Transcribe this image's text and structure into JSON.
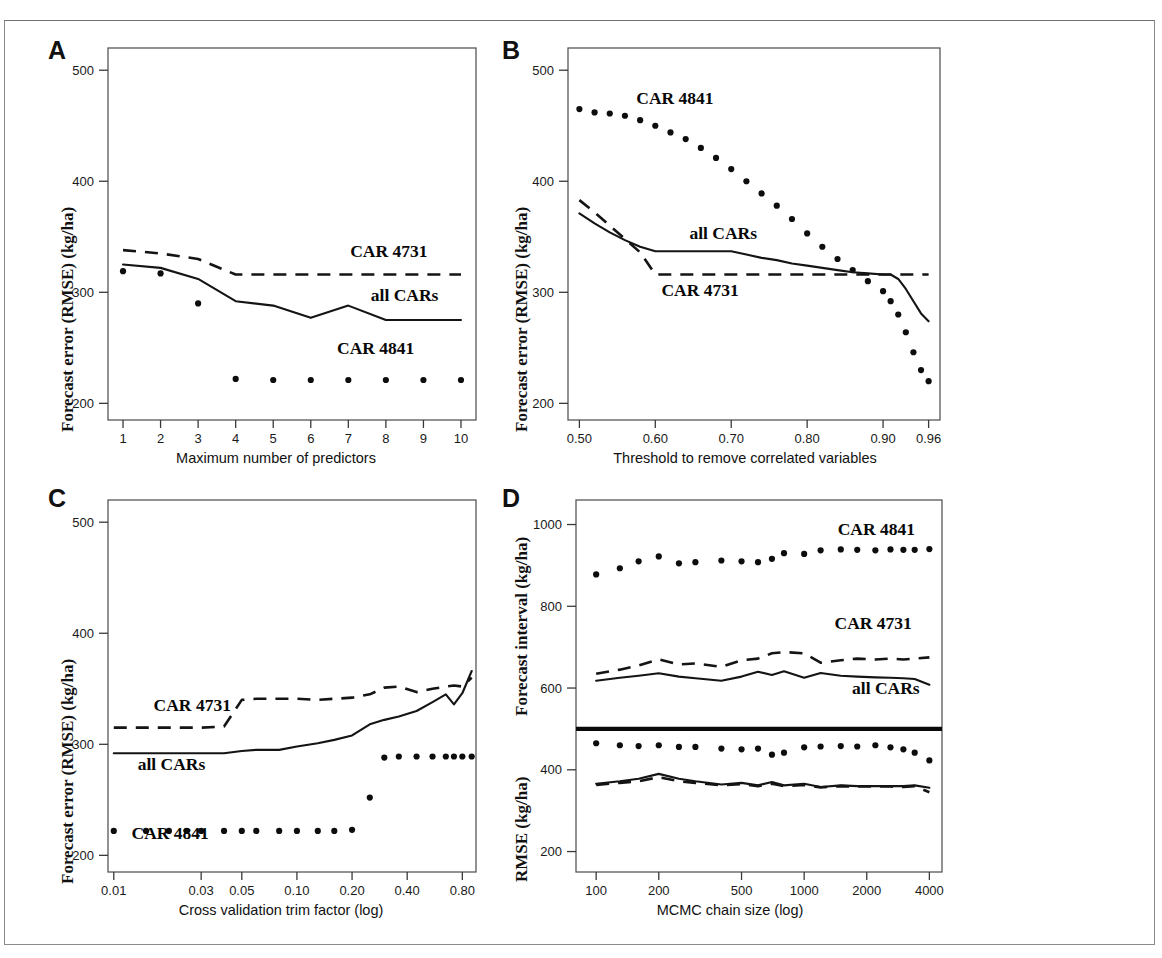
{
  "figure": {
    "panel_letters": [
      "A",
      "B",
      "C",
      "D"
    ],
    "series_names": [
      "CAR 4731",
      "all CARs",
      "CAR 4841"
    ],
    "line_styles": {
      "CAR 4731": "dashed",
      "all CARs": "solid",
      "CAR 4841": "dotted"
    },
    "ink_color": "#141414",
    "frame_color": "#4a4a4a",
    "background": "#ffffff"
  },
  "chart_data": [
    {
      "panel": "A",
      "type": "line",
      "title": "",
      "xlabel": "Maximum number of predictors",
      "ylabel": "Forecast error (RMSE) (kg/ha)",
      "xscale": "linear",
      "yscale": "linear",
      "xlim": [
        0.6,
        10.4
      ],
      "ylim": [
        185,
        520
      ],
      "xticks": [
        1,
        2,
        3,
        4,
        5,
        6,
        7,
        8,
        9,
        10
      ],
      "xticklabels": [
        "1",
        "2",
        "3",
        "4",
        "5",
        "6",
        "7",
        "8",
        "9",
        "10"
      ],
      "yticks": [
        200,
        300,
        400,
        500
      ],
      "yticklabels": [
        "200",
        "300",
        "400",
        "500"
      ],
      "grid": false,
      "legend": "inline-annotations",
      "x": [
        1,
        2,
        3,
        4,
        5,
        6,
        7,
        8,
        9,
        10
      ],
      "series": [
        {
          "name": "CAR 4731",
          "style": "dashed",
          "values": [
            338,
            335,
            330,
            316,
            316,
            316,
            316,
            316,
            316,
            316
          ],
          "label_pos": {
            "x": 7.05,
            "y": 332
          }
        },
        {
          "name": "all CARs",
          "style": "solid",
          "values": [
            325,
            322,
            312,
            292,
            288,
            277,
            288,
            275,
            275,
            275
          ],
          "label_pos": {
            "x": 7.6,
            "y": 292
          }
        },
        {
          "name": "CAR 4841",
          "style": "dotted",
          "values": [
            319,
            317,
            290,
            222,
            221,
            221,
            221,
            221,
            221,
            221
          ],
          "label_pos": {
            "x": 6.7,
            "y": 244
          }
        }
      ]
    },
    {
      "panel": "B",
      "type": "line",
      "title": "",
      "xlabel": "Threshold to remove correlated variables",
      "ylabel": "Forecast error (RMSE) (kg/ha)",
      "xscale": "linear",
      "yscale": "linear",
      "xlim": [
        0.485,
        0.975
      ],
      "ylim": [
        185,
        520
      ],
      "xticks": [
        0.5,
        0.6,
        0.7,
        0.8,
        0.9,
        0.96
      ],
      "xticklabels": [
        "0.50",
        "0.60",
        "0.70",
        "0.80",
        "0.90",
        "0.96"
      ],
      "yticks": [
        200,
        300,
        400,
        500
      ],
      "yticklabels": [
        "200",
        "300",
        "400",
        "500"
      ],
      "grid": false,
      "legend": "inline-annotations",
      "x": [
        0.5,
        0.52,
        0.54,
        0.56,
        0.58,
        0.6,
        0.62,
        0.64,
        0.66,
        0.68,
        0.7,
        0.72,
        0.74,
        0.76,
        0.78,
        0.8,
        0.82,
        0.84,
        0.86,
        0.88,
        0.9,
        0.91,
        0.92,
        0.93,
        0.94,
        0.95,
        0.96
      ],
      "series": [
        {
          "name": "CAR 4841",
          "style": "dotted",
          "values": [
            465,
            462,
            461,
            459,
            455,
            450,
            444,
            438,
            430,
            421,
            411,
            400,
            389,
            378,
            366,
            353,
            341,
            330,
            320,
            310,
            301,
            292,
            280,
            264,
            246,
            230,
            220
          ],
          "label_pos": {
            "x": 0.575,
            "y": 470
          }
        },
        {
          "name": "all CARs",
          "style": "solid",
          "values": [
            371,
            362,
            354,
            347,
            341,
            337,
            337,
            337,
            337,
            337,
            337,
            334,
            331,
            329,
            326,
            324,
            322,
            320,
            318,
            317,
            316,
            316,
            312,
            303,
            292,
            281,
            274
          ],
          "label_pos": {
            "x": 0.645,
            "y": 348
          }
        },
        {
          "name": "CAR 4731",
          "style": "dashed",
          "values": [
            383,
            372,
            360,
            348,
            336,
            316,
            316,
            316,
            316,
            316,
            316,
            316,
            316,
            316,
            316,
            316,
            316,
            316,
            316,
            316,
            316,
            316,
            316,
            316,
            316,
            316,
            316
          ],
          "label_pos": {
            "x": 0.608,
            "y": 297
          }
        }
      ]
    },
    {
      "panel": "C",
      "type": "line",
      "title": "",
      "xlabel": "Cross validation trim factor (log)",
      "ylabel": "Forecast error (RMSE) (kg/ha)",
      "xscale": "log",
      "yscale": "linear",
      "xlim": [
        0.0093,
        0.95
      ],
      "ylim": [
        185,
        520
      ],
      "xticks": [
        0.01,
        0.03,
        0.05,
        0.1,
        0.2,
        0.4,
        0.8
      ],
      "xticklabels": [
        "0.01",
        "0.03",
        "0.05",
        "0.10",
        "0.20",
        "0.40",
        "0.80"
      ],
      "yticks": [
        200,
        300,
        400,
        500
      ],
      "yticklabels": [
        "200",
        "300",
        "400",
        "500"
      ],
      "grid": false,
      "legend": "inline-annotations",
      "x": [
        0.01,
        0.015,
        0.02,
        0.025,
        0.03,
        0.04,
        0.05,
        0.06,
        0.08,
        0.1,
        0.13,
        0.16,
        0.2,
        0.25,
        0.3,
        0.36,
        0.45,
        0.55,
        0.65,
        0.72,
        0.8,
        0.9
      ],
      "series": [
        {
          "name": "CAR 4731",
          "style": "dashed",
          "values": [
            315,
            315,
            315,
            315,
            315,
            316,
            340,
            341,
            341,
            341,
            340,
            341,
            342,
            345,
            351,
            352,
            347,
            350,
            352,
            353,
            352,
            360
          ],
          "label_pos": {
            "x": 0.0165,
            "y": 330
          }
        },
        {
          "name": "all CARs",
          "style": "solid",
          "values": [
            292,
            292,
            292,
            292,
            292,
            292,
            294,
            295,
            295,
            298,
            301,
            304,
            308,
            318,
            322,
            325,
            330,
            338,
            345,
            336,
            346,
            366
          ],
          "label_pos": {
            "x": 0.0135,
            "y": 277
          }
        },
        {
          "name": "CAR 4841",
          "style": "dotted",
          "values": [
            222,
            222,
            222,
            222,
            222,
            222,
            222,
            222,
            222,
            222,
            222,
            222,
            223,
            252,
            288,
            289,
            289,
            289,
            289,
            289,
            289,
            289
          ],
          "label_pos": {
            "x": 0.0125,
            "y": 215
          }
        }
      ]
    },
    {
      "panel": "D",
      "type": "line",
      "title": "",
      "xlabel": "MCMC chain size (log)",
      "ylabel_upper": "Forecast interval (kg/ha)",
      "ylabel_lower": "RMSE (kg/ha)",
      "xscale": "log",
      "yscale": "linear",
      "xlim": [
        80,
        4600
      ],
      "ylim": [
        150,
        1060
      ],
      "xticks": [
        100,
        200,
        500,
        1000,
        2000,
        4000
      ],
      "xticklabels": [
        "100",
        "200",
        "500",
        "1000",
        "2000",
        "4000"
      ],
      "yticks": [
        200,
        400,
        600,
        800,
        1000
      ],
      "yticklabels": [
        "200",
        "400",
        "600",
        "800",
        "1000"
      ],
      "grid": false,
      "legend": "inline-annotations",
      "divider_y": 500,
      "x": [
        100,
        130,
        160,
        200,
        250,
        300,
        400,
        500,
        600,
        700,
        800,
        1000,
        1200,
        1500,
        1800,
        2200,
        2600,
        3000,
        3400,
        4000
      ],
      "series": [
        {
          "name": "CAR 4841 interval",
          "display_name": "CAR 4841",
          "style": "dotted",
          "values": [
            878,
            893,
            910,
            922,
            905,
            908,
            912,
            910,
            908,
            916,
            930,
            928,
            937,
            939,
            938,
            937,
            939,
            938,
            938,
            940
          ],
          "label_pos": {
            "x": 1450,
            "y": 975
          }
        },
        {
          "name": "CAR 4731 interval",
          "display_name": "CAR 4731",
          "style": "dashed",
          "values": [
            635,
            645,
            655,
            670,
            658,
            660,
            652,
            668,
            672,
            685,
            688,
            685,
            662,
            668,
            672,
            670,
            672,
            670,
            672,
            675
          ],
          "label_pos": {
            "x": 1400,
            "y": 745
          }
        },
        {
          "name": "all CARs interval",
          "display_name": "all CARs",
          "style": "solid",
          "values": [
            618,
            625,
            630,
            636,
            628,
            624,
            618,
            628,
            640,
            632,
            641,
            625,
            637,
            630,
            628,
            626,
            625,
            624,
            622,
            608
          ],
          "label_pos": {
            "x": 1700,
            "y": 585
          }
        },
        {
          "name": "CAR 4841 rmse",
          "display_name": "",
          "style": "dotted",
          "values": [
            465,
            460,
            458,
            460,
            456,
            456,
            452,
            450,
            452,
            437,
            442,
            455,
            457,
            458,
            457,
            460,
            455,
            450,
            442,
            423
          ],
          "label_pos": null
        },
        {
          "name": "all CARs rmse",
          "display_name": "",
          "style": "solid",
          "values": [
            366,
            372,
            378,
            390,
            378,
            372,
            364,
            368,
            362,
            370,
            362,
            366,
            358,
            362,
            360,
            360,
            360,
            360,
            362,
            356
          ],
          "label_pos": null
        },
        {
          "name": "CAR 4731 rmse",
          "display_name": "",
          "style": "dashed",
          "values": [
            363,
            368,
            372,
            382,
            372,
            368,
            362,
            365,
            360,
            366,
            360,
            363,
            357,
            360,
            359,
            359,
            359,
            358,
            360,
            345
          ],
          "label_pos": null
        }
      ]
    }
  ]
}
